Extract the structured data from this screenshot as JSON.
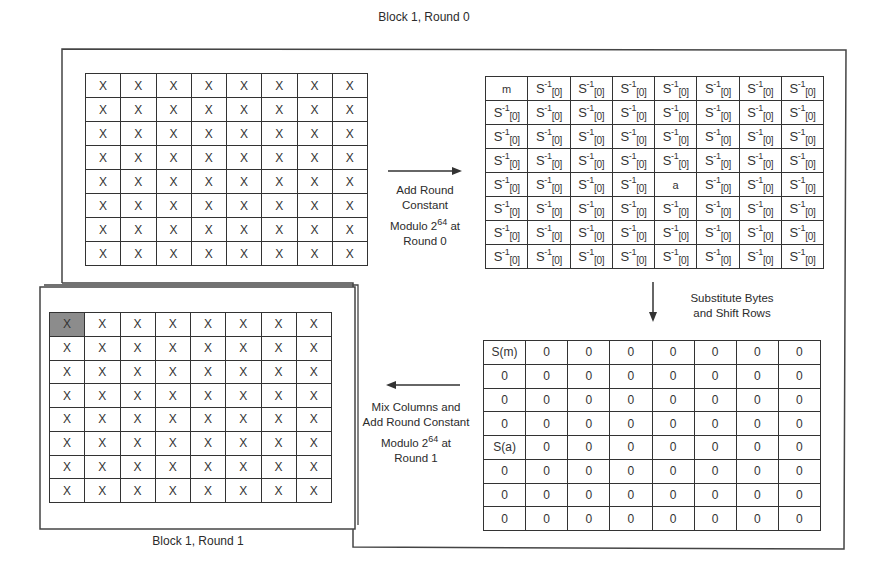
{
  "titles": {
    "top": "Block 1, Round 0",
    "bottom": "Block 1, Round 1"
  },
  "grid_initial": {
    "rows": [
      [
        "X",
        "X",
        "X",
        "X",
        "X",
        "X",
        "X",
        "X"
      ],
      [
        "X",
        "X",
        "X",
        "X",
        "X",
        "X",
        "X",
        "X"
      ],
      [
        "X",
        "X",
        "X",
        "X",
        "X",
        "X",
        "X",
        "X"
      ],
      [
        "X",
        "X",
        "X",
        "X",
        "X",
        "X",
        "X",
        "X"
      ],
      [
        "X",
        "X",
        "X",
        "X",
        "X",
        "X",
        "X",
        "X"
      ],
      [
        "X",
        "X",
        "X",
        "X",
        "X",
        "X",
        "X",
        "X"
      ],
      [
        "X",
        "X",
        "X",
        "X",
        "X",
        "X",
        "X",
        "X"
      ],
      [
        "X",
        "X",
        "X",
        "X",
        "X",
        "X",
        "X",
        "X"
      ]
    ]
  },
  "grid_round0": {
    "cell_default": {
      "base": "S",
      "sup": "-1",
      "sub": "[0]"
    },
    "special": [
      {
        "row": 0,
        "col": 0,
        "text": "m"
      },
      {
        "row": 4,
        "col": 4,
        "text": "a"
      }
    ]
  },
  "grid_subbytes": {
    "rows": [
      [
        "S(m)",
        "0",
        "0",
        "0",
        "0",
        "0",
        "0",
        "0"
      ],
      [
        "0",
        "0",
        "0",
        "0",
        "0",
        "0",
        "0",
        "0"
      ],
      [
        "0",
        "0",
        "0",
        "0",
        "0",
        "0",
        "0",
        "0"
      ],
      [
        "0",
        "0",
        "0",
        "0",
        "0",
        "0",
        "0",
        "0"
      ],
      [
        "S(a)",
        "0",
        "0",
        "0",
        "0",
        "0",
        "0",
        "0"
      ],
      [
        "0",
        "0",
        "0",
        "0",
        "0",
        "0",
        "0",
        "0"
      ],
      [
        "0",
        "0",
        "0",
        "0",
        "0",
        "0",
        "0",
        "0"
      ],
      [
        "0",
        "0",
        "0",
        "0",
        "0",
        "0",
        "0",
        "0"
      ]
    ]
  },
  "grid_round1": {
    "rows": [
      [
        "X",
        "X",
        "X",
        "X",
        "X",
        "X",
        "X",
        "X"
      ],
      [
        "X",
        "X",
        "X",
        "X",
        "X",
        "X",
        "X",
        "X"
      ],
      [
        "X",
        "X",
        "X",
        "X",
        "X",
        "X",
        "X",
        "X"
      ],
      [
        "X",
        "X",
        "X",
        "X",
        "X",
        "X",
        "X",
        "X"
      ],
      [
        "X",
        "X",
        "X",
        "X",
        "X",
        "X",
        "X",
        "X"
      ],
      [
        "X",
        "X",
        "X",
        "X",
        "X",
        "X",
        "X",
        "X"
      ],
      [
        "X",
        "X",
        "X",
        "X",
        "X",
        "X",
        "X",
        "X"
      ],
      [
        "X",
        "X",
        "X",
        "X",
        "X",
        "X",
        "X",
        "X"
      ]
    ],
    "shaded_cell": {
      "row": 0,
      "col": 0
    },
    "shade_color": "#8c8c8c"
  },
  "steps": {
    "add_round_constant": {
      "line1": "Add Round",
      "line2": "Constant",
      "line3_pre": "Modulo 2",
      "line3_sup": "64",
      "line3_post": " at",
      "line4": "Round 0"
    },
    "substitute": {
      "line1": "Substitute Bytes",
      "line2": "and Shift Rows"
    },
    "mix_columns": {
      "line1": "Mix Columns and",
      "line2": "Add Round Constant",
      "line3_pre": "Modulo 2",
      "line3_sup": "64",
      "line3_post": " at",
      "line4": "Round 1"
    }
  },
  "arrows": {
    "right": "arrow-right",
    "down": "arrow-down",
    "left": "arrow-left"
  }
}
